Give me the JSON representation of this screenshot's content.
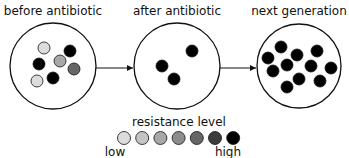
{
  "stages": [
    {
      "label": "before antibiotic",
      "cx": 53,
      "cy": 66,
      "r": 43,
      "dots": [
        {
          "x": 44,
          "y": 48,
          "level": 0
        },
        {
          "x": 70,
          "y": 51,
          "level": 6
        },
        {
          "x": 39,
          "y": 64,
          "level": 6
        },
        {
          "x": 60,
          "y": 61,
          "level": 2
        },
        {
          "x": 74,
          "y": 69,
          "level": 4
        },
        {
          "x": 53,
          "y": 78,
          "level": 6
        },
        {
          "x": 37,
          "y": 81,
          "level": 0
        }
      ]
    },
    {
      "label": "after antibiotic",
      "cx": 177,
      "cy": 66,
      "r": 43,
      "dots": [
        {
          "x": 192,
          "y": 51,
          "level": 6
        },
        {
          "x": 162,
          "y": 66,
          "level": 6
        },
        {
          "x": 174,
          "y": 79,
          "level": 6
        }
      ]
    },
    {
      "label": "next generation",
      "cx": 299,
      "cy": 66,
      "r": 42,
      "dots": [
        {
          "x": 281,
          "y": 47,
          "level": 6
        },
        {
          "x": 297,
          "y": 55,
          "level": 6
        },
        {
          "x": 317,
          "y": 51,
          "level": 6
        },
        {
          "x": 268,
          "y": 58,
          "level": 6
        },
        {
          "x": 287,
          "y": 65,
          "level": 6
        },
        {
          "x": 311,
          "y": 66,
          "level": 6
        },
        {
          "x": 331,
          "y": 68,
          "level": 6
        },
        {
          "x": 273,
          "y": 71,
          "level": 6
        },
        {
          "x": 299,
          "y": 79,
          "level": 6
        },
        {
          "x": 320,
          "y": 81,
          "level": 6
        },
        {
          "x": 287,
          "y": 87,
          "level": 6
        }
      ]
    }
  ],
  "legend": {
    "title": "resistance level",
    "low_label": "low",
    "high_label": "high",
    "colors": [
      "#dcdcdc",
      "#c4c4c4",
      "#a8a8a8",
      "#8c8c8c",
      "#666666",
      "#3c3c3c",
      "#000000"
    ]
  }
}
